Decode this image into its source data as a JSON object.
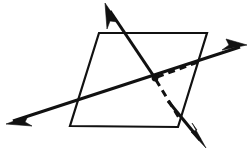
{
  "figure": {
    "title": "Two lines intersecting a plane at a point",
    "background_color": "#ffffff",
    "stroke_color": "#111111",
    "width": 250,
    "height": 152,
    "plane": {
      "name": "parallelogram-plane",
      "vertices": [
        {
          "label": "top-left",
          "x": 99,
          "y": 33
        },
        {
          "label": "top-right",
          "x": 207,
          "y": 33
        },
        {
          "label": "bottom-right",
          "x": 178,
          "y": 127
        },
        {
          "label": "bottom-left",
          "x": 70,
          "y": 126
        }
      ],
      "stroke_width": 2.2,
      "fill": "none"
    },
    "intersection_point": {
      "label": "intersection",
      "x": 155,
      "y": 78,
      "radius": 3.4
    },
    "lines": [
      {
        "name": "steep-line",
        "description": "steep double-headed ray from lower right to upper left",
        "start": {
          "x": 105,
          "y": 3
        },
        "end": {
          "x": 206,
          "y": 148
        },
        "style": "solid",
        "stroke_width": 3.1,
        "arrows": [
          "start",
          "end"
        ]
      },
      {
        "name": "shallow-line",
        "description": "shallow double-headed ray from lower left to upper right",
        "start": {
          "x": 6,
          "y": 124
        },
        "end": {
          "x": 247,
          "y": 45
        },
        "style": "solid",
        "stroke_width": 3.1,
        "arrows": [
          "start",
          "end"
        ]
      },
      {
        "name": "hidden-line-upper",
        "description": "dashed hidden portion from intersection toward right edge",
        "start": {
          "x": 155,
          "y": 78
        },
        "end": {
          "x": 197,
          "y": 62
        },
        "style": "dashed",
        "stroke_width": 3.0,
        "dash_pattern": "7 5",
        "arrows": []
      },
      {
        "name": "hidden-line-lower",
        "description": "dashed hidden portion from intersection down to bottom-right corner",
        "start": {
          "x": 155,
          "y": 78
        },
        "end": {
          "x": 181,
          "y": 121
        },
        "style": "dashed",
        "stroke_width": 3.0,
        "dash_pattern": "7 5",
        "arrows": []
      }
    ],
    "arrow_heads": [
      {
        "name": "arrow-top-left",
        "tip_x": 105,
        "tip_y": 3,
        "angle_deg": 235
      },
      {
        "name": "arrow-bottom-right",
        "tip_x": 206,
        "tip_y": 148,
        "angle_deg": 55
      },
      {
        "name": "arrow-left",
        "tip_x": 6,
        "tip_y": 124,
        "angle_deg": 198
      },
      {
        "name": "arrow-right",
        "tip_x": 247,
        "tip_y": 45,
        "angle_deg": 18
      }
    ]
  }
}
